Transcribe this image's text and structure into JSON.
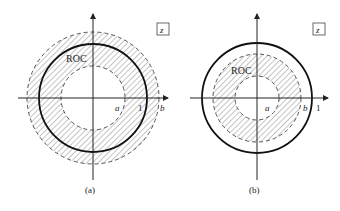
{
  "figure": {
    "panels": [
      {
        "id": "a",
        "caption": "(a)",
        "plane_label": "z",
        "roc_label": "ROC",
        "axis_labels": {
          "a": "a",
          "one": "1",
          "b": "b"
        },
        "center": [
          93,
          98
        ],
        "radii": {
          "outer_dashed_b": 66,
          "unit_circle_solid": 54,
          "inner_dashed_a": 32
        },
        "description": "ROC annulus a < |z| < b containing the unit circle"
      },
      {
        "id": "b",
        "caption": "(b)",
        "plane_label": "z",
        "roc_label": "ROC",
        "axis_labels": {
          "a": "a",
          "b": "b",
          "one": "1"
        },
        "center": [
          257,
          98
        ],
        "radii": {
          "unit_circle_solid": 55,
          "outer_dashed_b": 44,
          "inner_dashed_a": 22
        },
        "description": "ROC annulus a < |z| < b inside the unit circle"
      }
    ]
  }
}
